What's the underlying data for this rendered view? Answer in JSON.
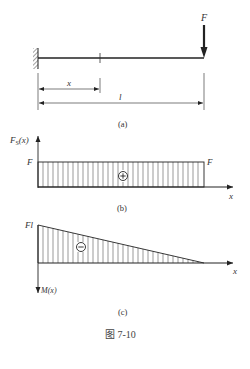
{
  "figure": {
    "caption": "图 7-10",
    "panels": {
      "a": {
        "label": "(a)",
        "force_label": "F",
        "dim_x_label": "x",
        "dim_l_label": "l"
      },
      "b": {
        "label": "(b)",
        "y_axis_label": "F",
        "y_axis_sub": "S",
        "y_axis_arg": "(x)",
        "x_axis_label": "x",
        "left_value_label": "F",
        "right_value_label": "F",
        "sign": "+"
      },
      "c": {
        "label": "(c)",
        "y_axis_label": "M(x)",
        "x_axis_label": "x",
        "max_value_label": "Fl",
        "sign": "−"
      }
    }
  },
  "colors": {
    "line": "#222222",
    "hatch": "#555555",
    "text": "#333333"
  }
}
